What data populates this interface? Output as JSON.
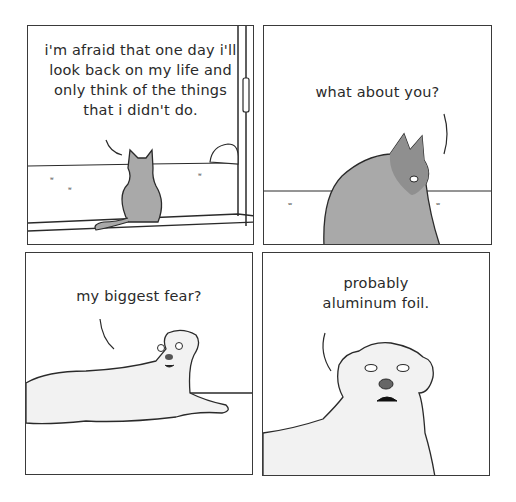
{
  "comic": {
    "panels": [
      {
        "id": 1,
        "speaker": "cat",
        "text": "i'm afraid that one day i'll\nlook back on my life and\nonly think of the things\nthat i didn't do."
      },
      {
        "id": 2,
        "speaker": "cat",
        "text": "what about you?"
      },
      {
        "id": 3,
        "speaker": "dog",
        "text": "my biggest fear?"
      },
      {
        "id": 4,
        "speaker": "dog",
        "text": "probably\naluminum foil."
      }
    ],
    "colors": {
      "line": "#2a2a2a",
      "cat_gray": "#a9a9a9",
      "cat_dark": "#8f8f8f",
      "dog_fill": "#f2f2f2"
    }
  }
}
